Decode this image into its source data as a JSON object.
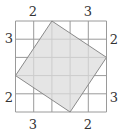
{
  "diagram": {
    "grid_size": 5,
    "square_vertices": [
      [
        2,
        0
      ],
      [
        5,
        2
      ],
      [
        3,
        5
      ],
      [
        0,
        3
      ]
    ],
    "colors": {
      "fill": "#dcdcdc",
      "stroke": "#8a8a8a",
      "grid": "#9a9a9a",
      "text": "#333333"
    },
    "labels": {
      "top_left": "2",
      "top_right": "3",
      "left_top": "3",
      "left_bottom": "2",
      "right_top": "2",
      "right_bottom": "3",
      "bottom_left": "3",
      "bottom_right": "2"
    }
  }
}
